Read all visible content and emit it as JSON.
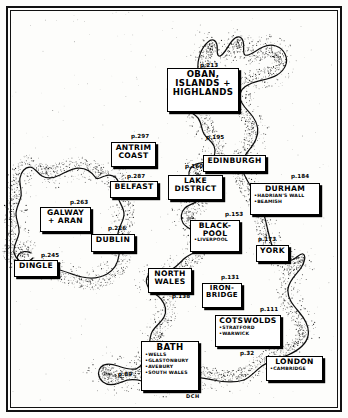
{
  "map": {
    "title": "Hand-drawn guidebook map of Britain and Ireland",
    "signature": "DCH",
    "ink_color": "#000000",
    "paper_color": "#fdfdfb"
  },
  "regions": [
    {
      "id": "oban",
      "title": "OBAN,\nISLANDS +\nHIGHLANDS",
      "page": "p.213",
      "subs": [],
      "x": 167,
      "y": 68,
      "w": 72,
      "h": 44,
      "size": "t9",
      "page_x": 200,
      "page_y": 62
    },
    {
      "id": "antrim",
      "title": "ANTRIM\nCOAST",
      "page": "p.297",
      "subs": [],
      "x": 111,
      "y": 142,
      "w": 45,
      "h": 25,
      "size": "t8",
      "page_x": 131,
      "page_y": 133
    },
    {
      "id": "edinburgh",
      "title": "EDINBURGH",
      "page": "p.195",
      "subs": [],
      "x": 203,
      "y": 155,
      "w": 63,
      "h": 17,
      "size": "t8",
      "page_x": 206,
      "page_y": 134
    },
    {
      "id": "belfast",
      "title": "BELFAST",
      "page": "p.287",
      "subs": [],
      "x": 110,
      "y": 181,
      "w": 48,
      "h": 17,
      "size": "t8",
      "page_x": 127,
      "page_y": 173
    },
    {
      "id": "lakedistrict",
      "title": "LAKE\nDISTRICT",
      "page": "p.160",
      "subs": [],
      "x": 168,
      "y": 175,
      "w": 55,
      "h": 25,
      "size": "t8",
      "page_x": 185,
      "page_y": 163
    },
    {
      "id": "durham",
      "title": "DURHAM",
      "page": "p.184",
      "subs": [
        "HADRIAN'S WALL",
        "BEAMISH"
      ],
      "x": 250,
      "y": 183,
      "w": 70,
      "h": 32,
      "size": "t8",
      "page_x": 291,
      "page_y": 173
    },
    {
      "id": "galway",
      "title": "GALWAY\n+ ARAN",
      "page": "p.263",
      "subs": [],
      "x": 40,
      "y": 207,
      "w": 51,
      "h": 25,
      "size": "t8",
      "page_x": 70,
      "page_y": 199
    },
    {
      "id": "blackpool",
      "title": "BLACK-\nPOOL",
      "page": "p.153",
      "subs": [
        "LIVERPOOL"
      ],
      "x": 190,
      "y": 220,
      "w": 50,
      "h": 32,
      "size": "t8",
      "page_x": 225,
      "page_y": 211
    },
    {
      "id": "dublin",
      "title": "DUBLIN",
      "page": "p.226",
      "subs": [],
      "x": 91,
      "y": 234,
      "w": 44,
      "h": 18,
      "size": "t8",
      "page_x": 108,
      "page_y": 225
    },
    {
      "id": "york",
      "title": "YORK",
      "page": "p.173",
      "subs": [],
      "x": 256,
      "y": 245,
      "w": 33,
      "h": 17,
      "size": "t8",
      "page_x": 258,
      "page_y": 236
    },
    {
      "id": "dingle",
      "title": "DINGLE",
      "page": "p.245",
      "subs": [],
      "x": 14,
      "y": 260,
      "w": 44,
      "h": 17,
      "size": "t8",
      "page_x": 41,
      "page_y": 252
    },
    {
      "id": "northwales",
      "title": "NORTH\nWALES",
      "page": "p.138",
      "subs": [],
      "x": 148,
      "y": 268,
      "w": 44,
      "h": 25,
      "size": "t8",
      "page_x": 172,
      "page_y": 293
    },
    {
      "id": "ironbridge",
      "title": "IRON-\nBRIDGE",
      "page": "p.131",
      "subs": [],
      "x": 202,
      "y": 283,
      "w": 40,
      "h": 25,
      "size": "t7",
      "page_x": 221,
      "page_y": 274
    },
    {
      "id": "cotswolds",
      "title": "COTSWOLDS",
      "page": "p.111",
      "subs": [
        "STRATFORD",
        "WARWICK"
      ],
      "x": 215,
      "y": 315,
      "w": 66,
      "h": 32,
      "size": "t8",
      "page_x": 260,
      "page_y": 306
    },
    {
      "id": "bath",
      "title": "BATH",
      "page": "p.89",
      "subs": [
        "WELLS",
        "GLASTONBURY",
        "AVEBURY",
        "SOUTH WALES"
      ],
      "x": 141,
      "y": 341,
      "w": 58,
      "h": 50,
      "size": "t9",
      "page_x": 118,
      "page_y": 371
    },
    {
      "id": "london",
      "title": "LONDON",
      "page": "p.32",
      "subs": [
        "CAMBRIDGE"
      ],
      "x": 266,
      "y": 356,
      "w": 57,
      "h": 25,
      "size": "t8",
      "page_x": 240,
      "page_y": 350
    }
  ]
}
